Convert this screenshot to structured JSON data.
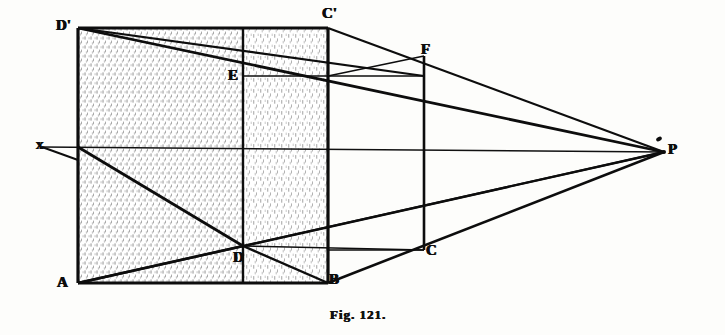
{
  "figure": {
    "caption": "Fig. 121.",
    "background_color": "#fdfdfb",
    "ink_color": "#0d0d0d"
  },
  "labels": [
    {
      "id": "D-prime",
      "text": "D'",
      "x": 56,
      "y": 18,
      "role": "vertex-top-left-front"
    },
    {
      "id": "C-prime",
      "text": "C'",
      "x": 322,
      "y": 6,
      "role": "vertex-top-right-front"
    },
    {
      "id": "F",
      "text": "F",
      "x": 421,
      "y": 42,
      "role": "vertex-top-right-back"
    },
    {
      "id": "E",
      "text": "E",
      "x": 228,
      "y": 68,
      "role": "vertex-interior-upper"
    },
    {
      "id": "X",
      "text": "x",
      "x": 36,
      "y": 137,
      "role": "horizon-line-left-end"
    },
    {
      "id": "P",
      "text": "P",
      "x": 668,
      "y": 142,
      "role": "vanishing-point"
    },
    {
      "id": "D",
      "text": "D",
      "x": 233,
      "y": 250,
      "role": "vertex-bottom-interior"
    },
    {
      "id": "C",
      "text": "C",
      "x": 426,
      "y": 243,
      "role": "vertex-bottom-right-back"
    },
    {
      "id": "A",
      "text": "A",
      "x": 57,
      "y": 275,
      "role": "vertex-bottom-left-front"
    },
    {
      "id": "B",
      "text": "B",
      "x": 329,
      "y": 272,
      "role": "vertex-bottom-right-front"
    }
  ],
  "geometry": {
    "vanishing_point": {
      "x": 664,
      "y": 152
    },
    "horizon_line": {
      "x1": 42,
      "y1": 147,
      "x2": 664,
      "y2": 152
    },
    "front_face": {
      "top_left": {
        "x": 78,
        "y": 28
      },
      "top_right": {
        "x": 328,
        "y": 28
      },
      "bottom_right": {
        "x": 328,
        "y": 283
      },
      "bottom_left": {
        "x": 78,
        "y": 283
      }
    },
    "back_vertical": {
      "x": 424,
      "y_top": 56,
      "y_bottom": 250
    },
    "interior_vertical": {
      "x": 243,
      "y_top": 28,
      "y_bottom": 283
    },
    "point_E": {
      "x": 243,
      "y": 76
    },
    "point_D": {
      "x": 243,
      "y": 246
    },
    "point_F": {
      "x": 424,
      "y": 56
    },
    "point_C": {
      "x": 424,
      "y": 250
    }
  }
}
